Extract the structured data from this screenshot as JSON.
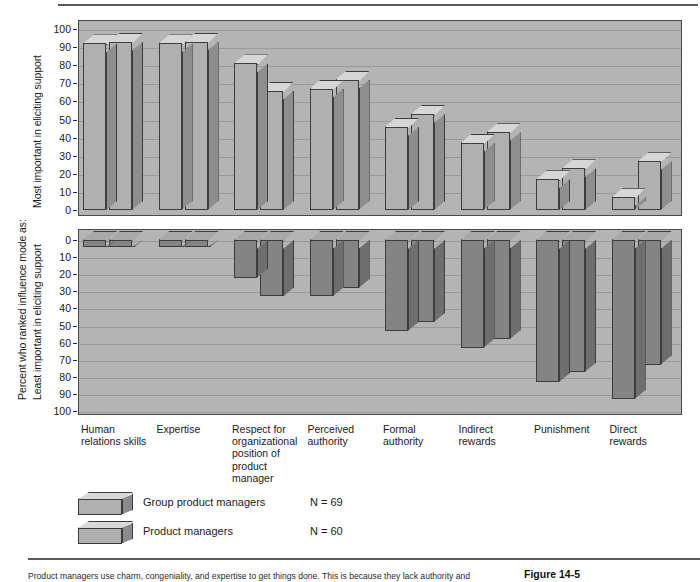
{
  "figure": {
    "number": "Figure 14-5",
    "caption": "Product managers use charm, congeniality, and expertise to get things done. This is because they lack authority and"
  },
  "axis": {
    "main_label": "Percent who ranked influence mode as:",
    "top_label": "Most important in eliciting support",
    "bottom_label": "Least important in eliciting support",
    "ticks": [
      "0",
      "10",
      "20",
      "30",
      "40",
      "50",
      "60",
      "70",
      "80",
      "90",
      "100"
    ]
  },
  "legend": {
    "items": [
      {
        "name": "Group product managers",
        "n": "N = 69"
      },
      {
        "name": "Product managers",
        "n": "N = 60"
      }
    ]
  },
  "chart_data": {
    "type": "bar",
    "title": "Percent who ranked influence mode as:",
    "xlabel": "",
    "ylabel": "Percent who ranked influence mode as:",
    "grid": true,
    "legend_position": "bottom-left",
    "categories": [
      "Human\nrelations skills",
      "Expertise",
      "Respect for\norganizational\nposition of\nproduct\nmanager",
      "Perceived\nauthority",
      "Formal\nauthority",
      "Indirect\nrewards",
      "Punishment",
      "Direct\nrewards"
    ],
    "panels": [
      {
        "name": "Most important in eliciting support",
        "ylim": [
          0,
          100
        ],
        "direction": "up",
        "series": [
          {
            "name": "Group product managers",
            "values": [
              92,
              92,
              81,
              67,
              46,
              37,
              17,
              7
            ]
          },
          {
            "name": "Product managers",
            "values": [
              93,
              93,
              66,
              72,
              53,
              43,
              23,
              27
            ]
          }
        ]
      },
      {
        "name": "Least important in eliciting support",
        "ylim": [
          0,
          100
        ],
        "direction": "down",
        "series": [
          {
            "name": "Group product managers",
            "values": [
              4,
              4,
              22,
              33,
              53,
              63,
              83,
              93
            ]
          },
          {
            "name": "Product managers",
            "values": [
              4,
              4,
              33,
              28,
              48,
              58,
              77,
              73
            ]
          }
        ]
      }
    ]
  }
}
